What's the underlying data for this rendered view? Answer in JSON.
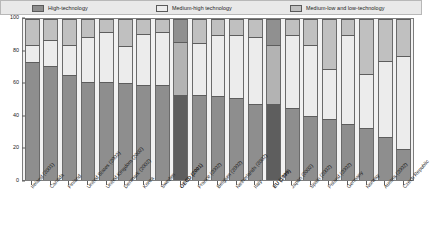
{
  "legend": {
    "items": [
      {
        "label": "High-technology",
        "color": "#8e8e8e",
        "key": "high"
      },
      {
        "label": "Medium-high technology",
        "color": "#ececec",
        "key": "medium_high"
      },
      {
        "label": "Medium-low and low-technology",
        "color": "#c0c0c0",
        "key": "medium_low_low"
      }
    ]
  },
  "yaxis": {
    "ticks": [
      "0",
      "20",
      "40",
      "60",
      "80",
      "100"
    ],
    "min": 0,
    "max": 100
  },
  "chart_data": {
    "type": "bar",
    "stacked": true,
    "orientation": "vertical",
    "title": "",
    "subtitle": "",
    "xlabel": "",
    "ylabel": "",
    "ylim": [
      0,
      100
    ],
    "ytick_labels": [
      "0",
      "20",
      "40",
      "60",
      "80",
      "100"
    ],
    "grid": false,
    "legend_position": "top",
    "categories": [
      "Ireland (2001)",
      "Canada",
      "Finland",
      "United States (2002)",
      "United Kingdom (2002)",
      "Denmark (2002)",
      "Korea",
      "Sweden",
      "OECD (2001)",
      "France (2002)",
      "Belgium (2002)",
      "Netherlands (2002)",
      "Italy",
      "EU (1999)",
      "Japan (2002)",
      "Spain (2002)",
      "Poland (2002)",
      "Germany",
      "Norway",
      "Austria (2002)",
      "Czech Republic"
    ],
    "highlighted_categories": [
      "OECD (2001)",
      "EU (1999)"
    ],
    "series": [
      {
        "name": "High-technology",
        "color": "#8e8e8e",
        "values": [
          73,
          71,
          65,
          61,
          61,
          60,
          59,
          59,
          53,
          53,
          52,
          51,
          47,
          47,
          45,
          40,
          38,
          35,
          32,
          27,
          19
        ]
      },
      {
        "name": "Medium-high technology",
        "color": "#ececec",
        "values": [
          11,
          16,
          19,
          28,
          31,
          23,
          32,
          33,
          33,
          32,
          38,
          39,
          42,
          37,
          45,
          44,
          31,
          55,
          34,
          47,
          58
        ]
      },
      {
        "name": "Medium-low and low-technology",
        "color": "#c0c0c0",
        "values": [
          16,
          13,
          16,
          11,
          8,
          17,
          9,
          8,
          14,
          15,
          10,
          10,
          11,
          16,
          10,
          16,
          31,
          10,
          34,
          26,
          23
        ]
      }
    ]
  }
}
